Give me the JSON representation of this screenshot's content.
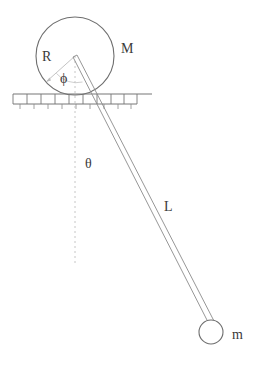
{
  "diagram": {
    "colors": {
      "stroke": "#6e6e6e",
      "stroke_dark": "#4a4a4a",
      "label": "#3a3a3a",
      "background": "#ffffff",
      "dashed": "#b9b9b9"
    },
    "labels": {
      "disk_mass": "M",
      "disk_radius": "R",
      "disk_rotation_angle": "ϕ",
      "pendulum_angle": "θ",
      "pendulum_length": "L",
      "bob_mass": "m"
    },
    "label_positions": {
      "disk_mass": {
        "x": 121,
        "y": 53
      },
      "disk_radius": {
        "x": 42,
        "y": 61
      },
      "disk_rotation_angle": {
        "x": 60,
        "y": 83
      },
      "pendulum_angle": {
        "x": 85,
        "y": 168
      },
      "pendulum_length": {
        "x": 164,
        "y": 211
      },
      "bob_mass": {
        "x": 232,
        "y": 339
      }
    },
    "geometry": {
      "disk": {
        "cx": 75,
        "cy": 56,
        "r": 39
      },
      "ground": {
        "x_left": 13,
        "x_right": 137,
        "y_top": 94,
        "y_bottom": 104,
        "tick_length": 5,
        "cell_count": 9
      },
      "pendulum": {
        "pivot_x": 75,
        "pivot_y": 56,
        "bob_x": 211,
        "bob_y": 332,
        "rod_half_width": 2.2
      },
      "bob": {
        "cx": 211,
        "cy": 332,
        "r": 12
      },
      "vertical_dashed": {
        "x": 75,
        "y_top": 56,
        "y_bottom": 266
      },
      "radius_line": {
        "x1": 75,
        "y1": 56,
        "x2": 46,
        "y2": 82
      },
      "phi_arc": {
        "cx": 75,
        "cy": 56,
        "r": 26
      }
    }
  }
}
